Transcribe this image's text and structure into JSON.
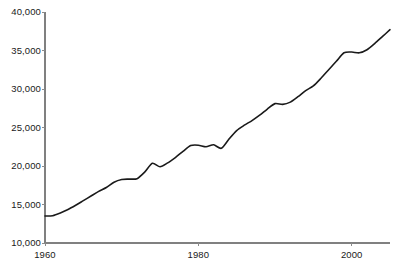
{
  "chart_data": {
    "type": "line",
    "title": "",
    "subtitle": "",
    "xlabel": "",
    "ylabel": "",
    "xlim": [
      1960,
      2005
    ],
    "ylim": [
      10000,
      40000
    ],
    "grid": false,
    "legend": null,
    "x_ticks": [
      1960,
      1980,
      2000
    ],
    "x_tick_labels": [
      "1960",
      "1980",
      "2000"
    ],
    "y_ticks": [
      10000,
      15000,
      20000,
      25000,
      30000,
      35000,
      40000
    ],
    "y_tick_labels": [
      "10,000",
      "15,000",
      "20,000",
      "25,000",
      "30,000",
      "35,000",
      "40,000"
    ],
    "line_color": "#1a1a1a",
    "axis_color": "#808080",
    "background_color": "#ffffff",
    "series": [
      {
        "name": "series-1",
        "x": [
          1960,
          1961,
          1962,
          1963,
          1964,
          1965,
          1966,
          1967,
          1968,
          1969,
          1970,
          1971,
          1972,
          1973,
          1974,
          1975,
          1976,
          1977,
          1978,
          1979,
          1980,
          1981,
          1982,
          1983,
          1984,
          1985,
          1986,
          1987,
          1988,
          1989,
          1990,
          1991,
          1992,
          1993,
          1994,
          1995,
          1996,
          1997,
          1998,
          1999,
          2000,
          2001,
          2002,
          2003,
          2004,
          2005
        ],
        "values": [
          13500,
          13550,
          13900,
          14350,
          14900,
          15500,
          16100,
          16700,
          17200,
          17900,
          18250,
          18300,
          18350,
          19200,
          20350,
          19900,
          20400,
          21100,
          21900,
          22650,
          22700,
          22500,
          22750,
          22300,
          23500,
          24600,
          25300,
          25900,
          26600,
          27400,
          28100,
          28000,
          28300,
          29000,
          29800,
          30400,
          31400,
          32500,
          33600,
          34700,
          34800,
          34700,
          35100,
          35900,
          36800,
          37700
        ]
      }
    ]
  },
  "geometry": {
    "plot_left": 45,
    "plot_right": 390,
    "plot_top": 12,
    "plot_bottom": 243
  }
}
